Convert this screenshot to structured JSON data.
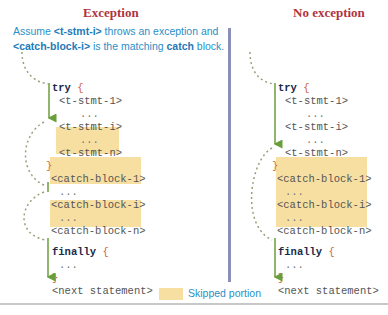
{
  "titles": {
    "left": "Exception",
    "right": "No exception"
  },
  "note": {
    "line1_pre": "Assume ",
    "line1_bold": "<t-stmt-i>",
    "line1_post": " throws an exception and",
    "line2_bold": "<catch-block-i>",
    "line2_mid": " is the matching ",
    "line2_bold2": "catch",
    "line2_post": " block."
  },
  "code": {
    "try_kw": "try",
    "open_brace": "{",
    "close_brace": "}",
    "t_stmt_1": "<t-stmt-1>",
    "t_stmt_i": "<t-stmt-i>",
    "t_stmt_n": "<t-stmt-n>",
    "dots": "...",
    "catch_block_1": "<catch-block-1>",
    "catch_block_i": "<catch-block-i>",
    "catch_block_n": "<catch-block-n>",
    "finally_kw": "finally",
    "next_statement": "<next statement>"
  },
  "legend": {
    "label": "Skipped portion",
    "color": "#f7dfa1"
  },
  "colors": {
    "title": "#b0333e",
    "note": "#2a8fc7",
    "highlight": "#f7dfa1",
    "flow_arrow": "#6a9e3a",
    "jump_dotted": "#9aa07a",
    "divider": "#8c8fb8"
  }
}
